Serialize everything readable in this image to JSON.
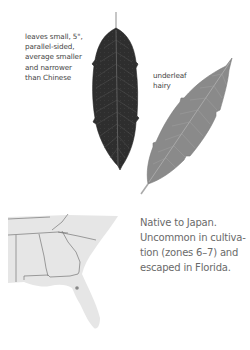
{
  "illustration": {
    "leaf_upper": {
      "label": "upper-leaf",
      "color": "#2e2e2e"
    },
    "leaf_under": {
      "label": "underside-leaf",
      "color": "#8a8a8a"
    }
  },
  "notes": {
    "leaves": [
      "leaves small, 5\",",
      "parallel-sided,",
      "average smaller",
      "and narrower",
      "than Chinese"
    ],
    "underleaf": [
      "underleaf",
      "hairy"
    ]
  },
  "range_map": {
    "fill": "#e6e6e6",
    "border_color": "#777777",
    "marker_color": "#888888"
  },
  "description": {
    "lines": [
      "Native to Japan.",
      "Uncommon in cultiva-",
      "tion (zones 6–7) and",
      "escaped in Florida."
    ]
  }
}
